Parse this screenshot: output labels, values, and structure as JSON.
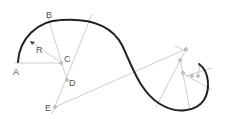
{
  "diagram": {
    "labels": {
      "A": "A",
      "B": "B",
      "C": "C",
      "D": "D",
      "E": "E",
      "R": "R"
    },
    "colors": {
      "curve": "#222222",
      "construction": "#b8b8b8",
      "label": "#555555"
    }
  }
}
